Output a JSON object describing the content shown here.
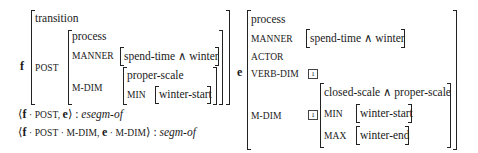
{
  "f": {
    "label": "f",
    "type": "transition",
    "feature": "POST",
    "post": {
      "type": "process",
      "manner_label": "MANNER",
      "manner_value": "spend-time ∧ winter",
      "mdim_label": "M-DIM",
      "mdim": {
        "type": "proper-scale",
        "min_label": "MIN",
        "min_value": "winter-start"
      }
    }
  },
  "e": {
    "label": "e",
    "type": "process",
    "manner_label": "MANNER",
    "manner_value": "spend-time ∧ winter",
    "actor_label": "ACTOR",
    "verbdim_label": "VERB-DIM",
    "verbdim_tag": "1",
    "mdim_label": "M-DIM",
    "mdim_tag": "1",
    "mdim": {
      "type": "closed-scale ∧ proper-scale",
      "min_label": "MIN",
      "min_value": "winter-start",
      "max_label": "MAX",
      "max_value": "winter-end"
    }
  },
  "relations": [
    {
      "open": "⟨",
      "arg1_var": "f",
      "arg1_path": " · POST, ",
      "arg2_var": "e",
      "arg2_path": "",
      "close": "⟩ : ",
      "name": "esegm-of"
    },
    {
      "open": "⟨",
      "arg1_var": "f",
      "arg1_path": " · POST · M-DIM, ",
      "arg2_var": "e",
      "arg2_path": " · M-DIM",
      "close": "⟩ : ",
      "name": "segm-of"
    }
  ]
}
